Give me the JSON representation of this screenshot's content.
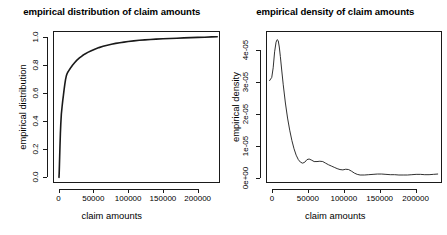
{
  "figure": {
    "background": "#ffffff",
    "line_color": "#1a1a1a",
    "panels": 2
  },
  "chart_data": [
    {
      "type": "line",
      "id": "ecdf",
      "title": "empirical distribution of claim amounts",
      "xlabel": "claim amounts",
      "ylabel": "empirical distribution",
      "xlim": [
        -8000,
        232000
      ],
      "ylim": [
        -0.04,
        1.04
      ],
      "xticks": [
        0,
        50000,
        100000,
        150000,
        200000
      ],
      "xticklabels": [
        "0",
        "50000",
        "100000",
        "150000",
        "200000"
      ],
      "yticks": [
        0.0,
        0.2,
        0.4,
        0.6,
        0.8,
        1.0
      ],
      "yticklabels": [
        "0.0",
        "0.2",
        "0.4",
        "0.6",
        "0.8",
        "1.0"
      ],
      "grid": false,
      "legend": null,
      "series": [
        {
          "name": "empirical distribution function",
          "x": [
            600,
            900,
            1200,
            1600,
            2000,
            2600,
            3200,
            4000,
            5000,
            6000,
            7000,
            8000,
            9000,
            10000,
            11000,
            12000,
            13000,
            14500,
            16000,
            18000,
            20000,
            23000,
            26000,
            30000,
            34000,
            38000,
            42000,
            47000,
            52000,
            58000,
            64000,
            70000,
            76000,
            82000,
            88000,
            94000,
            100000,
            108000,
            116000,
            124000,
            132000,
            140000,
            150000,
            160000,
            170000,
            180000,
            190000,
            200000,
            210000,
            220000,
            228000
          ],
          "y": [
            0.0,
            0.03,
            0.08,
            0.15,
            0.22,
            0.31,
            0.38,
            0.45,
            0.5,
            0.545,
            0.585,
            0.625,
            0.662,
            0.695,
            0.718,
            0.734,
            0.745,
            0.757,
            0.768,
            0.783,
            0.797,
            0.815,
            0.831,
            0.849,
            0.864,
            0.877,
            0.888,
            0.9,
            0.911,
            0.922,
            0.931,
            0.939,
            0.946,
            0.952,
            0.957,
            0.961,
            0.965,
            0.97,
            0.974,
            0.977,
            0.98,
            0.982,
            0.985,
            0.987,
            0.989,
            0.991,
            0.993,
            0.995,
            0.996,
            0.998,
            0.999
          ]
        }
      ]
    },
    {
      "type": "line",
      "id": "density",
      "title": "empirical density of claim amounts",
      "xlabel": "claim amounts",
      "ylabel": "empirical density",
      "xlim": [
        -9000,
        236000
      ],
      "ylim": [
        -1.5e-06,
        4.6e-05
      ],
      "xticks": [
        0,
        50000,
        100000,
        150000,
        200000
      ],
      "xticklabels": [
        "0",
        "50000",
        "100000",
        "150000",
        "200000"
      ],
      "yticks": [
        0.0,
        1e-05,
        2e-05,
        3e-05,
        4e-05
      ],
      "yticklabels": [
        "0e+00",
        "1e-05",
        "2e-05",
        "3e-05",
        "4e-05"
      ],
      "grid": false,
      "legend": null,
      "series": [
        {
          "name": "kernel density estimate",
          "x": [
            -4000,
            -1000,
            1000,
            3000,
            5000,
            6500,
            8000,
            9500,
            11000,
            13000,
            15000,
            18000,
            21000,
            24000,
            27000,
            30000,
            33000,
            36000,
            39000,
            42000,
            45000,
            48000,
            51000,
            54000,
            58000,
            62000,
            66000,
            70000,
            74000,
            78000,
            82000,
            86000,
            90000,
            94000,
            98000,
            102000,
            106000,
            110000,
            114000,
            118000,
            122000,
            128000,
            134000,
            140000,
            146000,
            152000,
            158000,
            164000,
            170000,
            176000,
            182000,
            188000,
            194000,
            200000,
            206000,
            212000,
            218000,
            224000,
            230000
          ],
          "y": [
            3.05e-05,
            3.15e-05,
            3.45e-05,
            3.95e-05,
            4.25e-05,
            4.33e-05,
            4.3e-05,
            4.1e-05,
            3.8e-05,
            3.35e-05,
            2.92e-05,
            2.35e-05,
            1.88e-05,
            1.5e-05,
            1.18e-05,
            9.2e-06,
            7.2e-06,
            5.8e-06,
            5e-06,
            4.7e-06,
            5e-06,
            5.8e-06,
            6e-06,
            5.7e-06,
            5.2e-06,
            5.2e-06,
            5.3e-06,
            5.2e-06,
            4.7e-06,
            4.2e-06,
            3.8e-06,
            3.4e-06,
            3e-06,
            2.7e-06,
            2.6e-06,
            2.8e-06,
            2.7e-06,
            2.2e-06,
            1.6e-06,
            1.2e-06,
            1e-06,
            1e-06,
            1.1e-06,
            1.2e-06,
            1.3e-06,
            1.3e-06,
            1.2e-06,
            1.1e-06,
            1.1e-06,
            1e-06,
            1e-06,
            1e-06,
            1.1e-06,
            1.2e-06,
            1.2e-06,
            1.1e-06,
            1.1e-06,
            1.2e-06,
            1.3e-06
          ]
        }
      ]
    }
  ]
}
